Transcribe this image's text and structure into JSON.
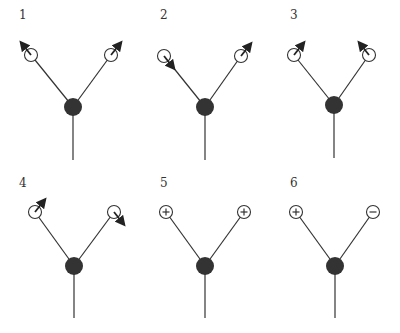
{
  "diagram": {
    "colors": {
      "central_atom": "#333333",
      "outer_atom_fill": "#ffffff",
      "line": "#333333"
    },
    "panels": [
      {
        "label": "1",
        "center": [
          73,
          107
        ],
        "left": [
          31,
          55
        ],
        "right": [
          111,
          55
        ],
        "stem_end": 160,
        "left_marker": {
          "type": "arrow",
          "direction": "up-left"
        },
        "right_marker": {
          "type": "arrow",
          "direction": "up-right"
        }
      },
      {
        "label": "2",
        "center": [
          205,
          107
        ],
        "left": [
          164,
          56
        ],
        "right": [
          241,
          56
        ],
        "stem_end": 160,
        "left_marker": {
          "type": "arrow",
          "direction": "down-right"
        },
        "right_marker": {
          "type": "arrow",
          "direction": "up-right"
        }
      },
      {
        "label": "3",
        "center": [
          334,
          105
        ],
        "left": [
          294,
          55
        ],
        "right": [
          369,
          55
        ],
        "stem_end": 158,
        "left_marker": {
          "type": "arrow",
          "direction": "up-right"
        },
        "right_marker": {
          "type": "arrow",
          "direction": "up-left"
        }
      },
      {
        "label": "4",
        "center": [
          74,
          266
        ],
        "left": [
          35,
          212
        ],
        "right": [
          114,
          212
        ],
        "stem_end": 318,
        "left_marker": {
          "type": "arrow",
          "direction": "up-right"
        },
        "right_marker": {
          "type": "arrow",
          "direction": "down-right"
        }
      },
      {
        "label": "5",
        "center": [
          205,
          266
        ],
        "left": [
          166,
          212
        ],
        "right": [
          244,
          212
        ],
        "stem_end": 318,
        "left_marker": {
          "type": "charge",
          "sign": "+"
        },
        "right_marker": {
          "type": "charge",
          "sign": "+"
        }
      },
      {
        "label": "6",
        "center": [
          335,
          266
        ],
        "left": [
          296,
          212
        ],
        "right": [
          373,
          212
        ],
        "stem_end": 318,
        "left_marker": {
          "type": "charge",
          "sign": "+"
        },
        "right_marker": {
          "type": "charge",
          "sign": "-"
        }
      }
    ],
    "label_positions": [
      [
        19,
        19
      ],
      [
        160,
        19
      ],
      [
        290,
        19
      ],
      [
        19,
        187
      ],
      [
        160,
        187
      ],
      [
        290,
        187
      ]
    ]
  }
}
